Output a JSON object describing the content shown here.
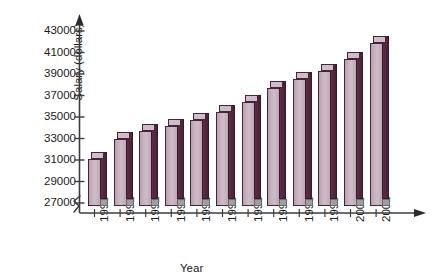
{
  "chart_data": {
    "type": "bar",
    "title": "",
    "xlabel": "Year",
    "ylabel": "Salary (dollars)",
    "categories": [
      "1990",
      "1991",
      "1992",
      "1993",
      "1994",
      "1995",
      "1996",
      "1997",
      "1998",
      "1999",
      "2000",
      "2001"
    ],
    "values": [
      31100,
      33000,
      33700,
      34200,
      34700,
      35500,
      36400,
      37700,
      38500,
      39300,
      40400,
      41900
    ],
    "ylim": [
      27000,
      43000
    ],
    "yticks": [
      27000,
      29000,
      31000,
      33000,
      35000,
      37000,
      39000,
      41000,
      43000
    ],
    "ytick_labels": [
      "27000",
      "29000",
      "31000",
      "33000",
      "35000",
      "37000",
      "39000",
      "41000",
      "43000"
    ],
    "axis_break": true,
    "grid": false,
    "legend": null,
    "bar_colors": {
      "front": "#c9b5c2",
      "side": "#4b2238",
      "top": "#cdbecb",
      "outline": "#4a2338",
      "shadow": "#9e9e9e"
    }
  }
}
